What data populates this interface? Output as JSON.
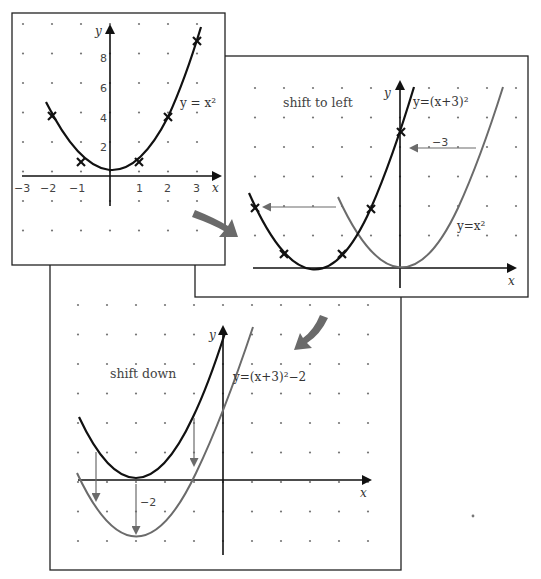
{
  "panels": {
    "original": {
      "equation_label": "y = x²",
      "axis_x_label": "x",
      "axis_y_label": "y",
      "x_ticks": [
        "−3",
        "−2",
        "−1",
        "1",
        "2",
        "3"
      ],
      "y_ticks": [
        "2",
        "4",
        "6",
        "8"
      ],
      "marked_points": [
        [
          -2,
          4
        ],
        [
          -1,
          1
        ],
        [
          1,
          1
        ],
        [
          2,
          4
        ],
        [
          3,
          9
        ]
      ]
    },
    "shift_left": {
      "title": "shift to left",
      "equation_shifted": "y=(x+3)²",
      "equation_original": "y=x²",
      "shift_label": "−3",
      "axis_x_label": "x",
      "axis_y_label": "y",
      "marked_points": [
        [
          -5,
          4
        ],
        [
          -4,
          1
        ],
        [
          -2,
          1
        ],
        [
          -1,
          4
        ],
        [
          0,
          9
        ]
      ]
    },
    "shift_down": {
      "title": "shift down",
      "equation": "y=(x+3)²−2",
      "shift_label": "−2",
      "axis_x_label": "x",
      "axis_y_label": "y"
    }
  },
  "colors": {
    "curve_original": "#111111",
    "curve_transformed": "#6b6b6b",
    "flow_arrow": "#6a6a6a"
  }
}
